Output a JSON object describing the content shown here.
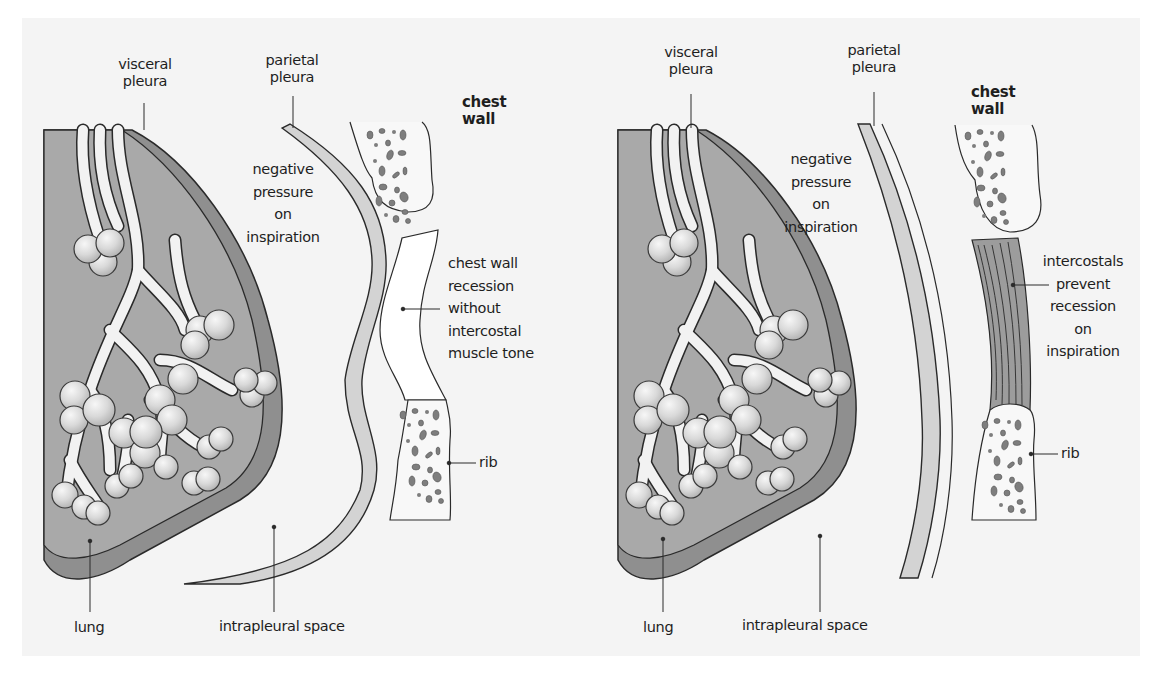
{
  "figure": {
    "colors": {
      "panel_bg": "#f4f4f4",
      "lung_fill": "#a9a9a9",
      "visceral_pleura_fill": "#8f8f8f",
      "parietal_pleura_fill": "#d3d3d3",
      "intercostal_fill": "#9c9c9c",
      "rib_spots": "#7e7e7e",
      "outline": "#2a2a2a"
    }
  },
  "left_panel": {
    "title": "Without intercostal muscle tone",
    "labels": {
      "visceral_pleura": [
        "visceral",
        "pleura"
      ],
      "parietal_pleura": [
        "parietal",
        "pleura"
      ],
      "chest_wall": [
        "chest",
        "wall"
      ],
      "negative_pressure": [
        "negative",
        "pressure",
        "on",
        "inspiration"
      ],
      "recession": [
        "chest wall",
        "recession",
        "without",
        "intercostal",
        "muscle tone"
      ],
      "rib": "rib",
      "lung": "lung",
      "intrapleural_space": "intrapleural space"
    }
  },
  "right_panel": {
    "title": "With intercostal muscle tone",
    "labels": {
      "visceral_pleura": [
        "visceral",
        "pleura"
      ],
      "parietal_pleura": [
        "parietal",
        "pleura"
      ],
      "chest_wall": [
        "chest",
        "wall"
      ],
      "negative_pressure": [
        "negative",
        "pressure",
        "on",
        "inspiration"
      ],
      "intercostals": [
        "intercostals",
        "prevent",
        "recession",
        "on",
        "inspiration"
      ],
      "rib": "rib",
      "lung": "lung",
      "intrapleural_space": "intrapleural space"
    }
  }
}
